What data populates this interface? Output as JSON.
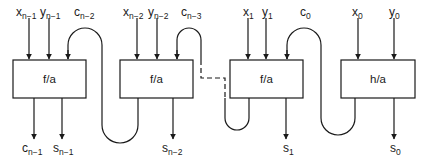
{
  "diagram": {
    "colors": {
      "stroke": "#1a1a1a",
      "background": "#ffffff"
    },
    "blocks": [
      {
        "id": "fa_n1",
        "label": "f/a"
      },
      {
        "id": "fa_n2",
        "label": "f/a"
      },
      {
        "id": "fa_1",
        "label": "f/a"
      },
      {
        "id": "ha_0",
        "label": "h/a"
      }
    ],
    "inputs": {
      "x_n1": {
        "base": "x",
        "sub": "n−1"
      },
      "y_n1": {
        "base": "y",
        "sub": "n−1"
      },
      "c_n2": {
        "base": "c",
        "sub": "n−2"
      },
      "x_n2": {
        "base": "x",
        "sub": "n−2"
      },
      "y_n2": {
        "base": "y",
        "sub": "n−2"
      },
      "c_n3": {
        "base": "c",
        "sub": "n−3"
      },
      "x_1": {
        "base": "x",
        "sub": "1"
      },
      "y_1": {
        "base": "y",
        "sub": "1"
      },
      "c_0": {
        "base": "c",
        "sub": "0"
      },
      "x_0": {
        "base": "x",
        "sub": "0"
      },
      "y_0": {
        "base": "y",
        "sub": "0"
      }
    },
    "outputs": {
      "c_n1": {
        "base": "c",
        "sub": "n−1"
      },
      "s_n1": {
        "base": "s",
        "sub": "n−1"
      },
      "s_n2": {
        "base": "s",
        "sub": "n−2"
      },
      "s_1": {
        "base": "s",
        "sub": "1"
      },
      "s_0": {
        "base": "s",
        "sub": "0"
      }
    },
    "connections": [
      {
        "from": "fa_n2",
        "to": "fa_n1",
        "signal": "c_n2",
        "style": "solid"
      },
      {
        "from": "fa_1",
        "to": "fa_n2",
        "signal": "c_n3",
        "style": "dashed"
      },
      {
        "from": "ha_0",
        "to": "fa_1",
        "signal": "c_0",
        "style": "solid"
      }
    ]
  }
}
